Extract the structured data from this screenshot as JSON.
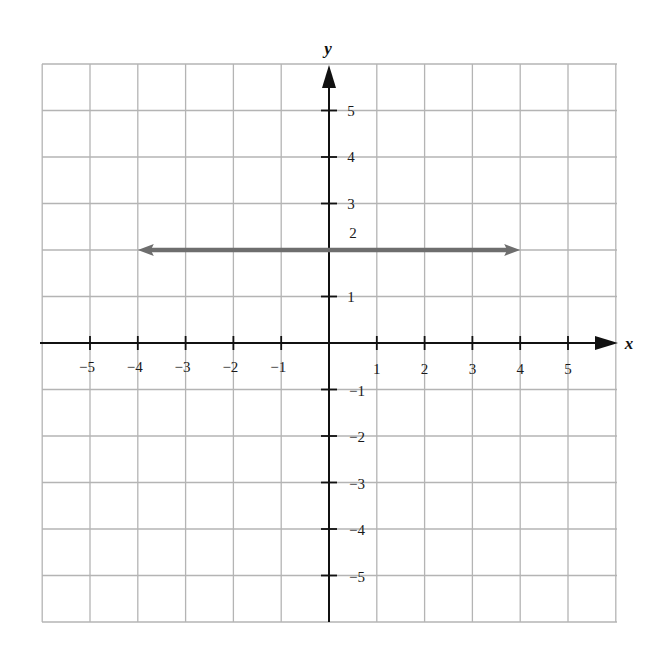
{
  "chart_data": {
    "type": "line",
    "title": "",
    "xlabel": "x",
    "ylabel": "y",
    "xlim": [
      -6,
      6
    ],
    "ylim": [
      -6,
      6
    ],
    "grid": true,
    "legend": null,
    "x_ticks": [
      -5,
      -4,
      -3,
      -2,
      -1,
      1,
      2,
      3,
      4,
      5
    ],
    "x_tick_labels": [
      "−5",
      "−4",
      "−3",
      "−2",
      "−1",
      "1",
      "2",
      "3",
      "4",
      "5"
    ],
    "y_ticks": [
      5,
      4,
      3,
      2,
      1,
      -1,
      -2,
      -3,
      -4,
      -5
    ],
    "y_tick_labels": [
      "5",
      "4",
      "3",
      "2",
      "1",
      "−1",
      "−2",
      "−3",
      "−4",
      "−5"
    ],
    "series": [
      {
        "name": "y = 2",
        "kind": "horizontal line with arrows at both ends",
        "x": [
          -4,
          4
        ],
        "y": [
          2,
          2
        ],
        "color": "#6e6e6e"
      }
    ],
    "axes_arrows": {
      "x_positive": true,
      "y_positive": true
    }
  },
  "style": {
    "grid_color": "#b4b4b4",
    "axis_color": "#111111",
    "line_color": "#6e6e6e"
  },
  "layout": {
    "origin_px": [
      329,
      343
    ],
    "unit_x_px": 47.8,
    "unit_y_px": 46.5,
    "grid_left_px": 42,
    "grid_top_px": 64,
    "grid_right_px": 617,
    "grid_bottom_px": 622
  }
}
